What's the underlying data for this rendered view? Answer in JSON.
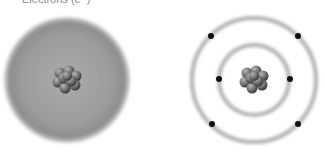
{
  "label": {
    "text": "Electrons (e⁻)"
  },
  "models": [
    {
      "name": "electron-cloud-model",
      "center": [
        67,
        80
      ],
      "cloud_radius": 64,
      "cloud_colors": {
        "inner": "#a9a9a9",
        "mid": "#9a9a9a",
        "edge": "#7f7f7f"
      }
    },
    {
      "name": "bohr-model",
      "center": [
        254,
        80
      ],
      "orbits": [
        {
          "radius": 35,
          "electrons": [
            [
              219,
              79
            ],
            [
              290,
              79
            ]
          ]
        },
        {
          "radius": 62,
          "electrons": [
            [
              211,
              36
            ],
            [
              298,
              36
            ],
            [
              212,
              124
            ],
            [
              298,
              124
            ]
          ]
        }
      ],
      "orbit_color": "#b8b8b8",
      "electron_color": "#111111"
    }
  ],
  "nucleus_color": {
    "light": "#9a9a9a",
    "dark": "#3c3c3c"
  }
}
